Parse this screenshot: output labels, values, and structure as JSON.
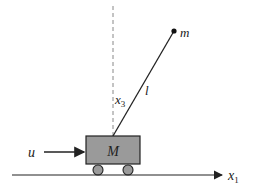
{
  "diagram": {
    "labels": {
      "bob_mass": "m",
      "pole_length": "l",
      "angle": "x",
      "angle_sub": "3",
      "cart_mass": "M",
      "force": "u",
      "position": "x",
      "position_sub": "1"
    },
    "colors": {
      "cart_fill": "#9a9a9a",
      "stroke": "#222222",
      "dashed": "#888888"
    }
  }
}
